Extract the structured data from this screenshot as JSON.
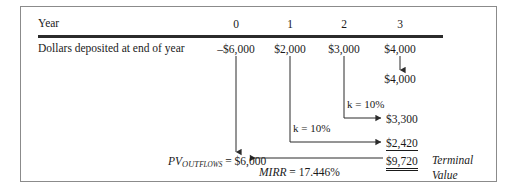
{
  "figure": {
    "row_labels": {
      "year": "Year",
      "cashflow": "Dollars deposited at end of year"
    },
    "columns": [
      {
        "year": "0",
        "amount": "–$6,000"
      },
      {
        "year": "1",
        "amount": "$2,000"
      },
      {
        "year": "2",
        "amount": "$3,000"
      },
      {
        "year": "3",
        "amount": "$4,000"
      }
    ],
    "compounded_values": {
      "year3_fv": "$4,000",
      "year2_fv": "$3,300",
      "year1_fv": "$2,420",
      "terminal_value": "$9,720"
    },
    "rate_labels": {
      "year2_rate": "k = 10%",
      "year1_rate": "k = 10%"
    },
    "pv_outflows": {
      "symbol": "PV",
      "subscript_caps": "OUT",
      "subscript_small": "FLOWS",
      "equals": "= $6,000"
    },
    "mirr": {
      "symbol": "MIRR",
      "value": "= 17.446%"
    },
    "terminal_label": {
      "line1": "Terminal",
      "line2": "Value"
    }
  },
  "colors": {
    "ink": "#1a1a1a",
    "rule": "#2b2b2b",
    "frame": "#8b8b8b",
    "background": "#ffffff"
  }
}
